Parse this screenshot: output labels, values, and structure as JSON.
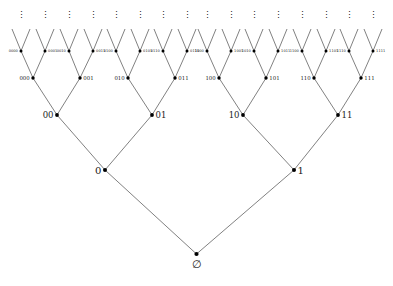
{
  "figure": {
    "kind": "binary-tree-diagram",
    "background_color": "#ffffff",
    "edge_color": "#2b2b2b",
    "node_color": "#000000",
    "label_color": "#1a1a1a",
    "width": 393,
    "height": 286,
    "max_drawn_depth": 4,
    "continuation_glyph": "⋮"
  },
  "levels": [
    {
      "depth": 0,
      "y": 254,
      "node_radius": 2.1,
      "font_size": 11,
      "label_placement": "below",
      "nodes": [
        {
          "id": "root",
          "label": "∅",
          "x": 196.5
        }
      ]
    },
    {
      "depth": 1,
      "y": 170,
      "node_radius": 2.0,
      "font_size": 10,
      "label_placement": "side",
      "nodes": [
        {
          "id": "0",
          "label": "0",
          "x": 105,
          "side": "left"
        },
        {
          "id": "1",
          "label": "1",
          "x": 294,
          "side": "right"
        }
      ]
    },
    {
      "depth": 2,
      "y": 115,
      "node_radius": 1.9,
      "font_size": 8.5,
      "label_placement": "side",
      "nodes": [
        {
          "id": "00",
          "label": "00",
          "x": 57,
          "side": "left"
        },
        {
          "id": "01",
          "label": "01",
          "x": 152,
          "side": "right"
        },
        {
          "id": "10",
          "label": "10",
          "x": 243,
          "side": "left"
        },
        {
          "id": "11",
          "label": "11",
          "x": 338,
          "side": "right"
        }
      ]
    },
    {
      "depth": 3,
      "y": 78,
      "node_radius": 1.7,
      "font_size": 5.4,
      "label_placement": "side",
      "nodes": [
        {
          "id": "000",
          "label": "000",
          "x": 33,
          "side": "left"
        },
        {
          "id": "001",
          "label": "001",
          "x": 80,
          "side": "right"
        },
        {
          "id": "010",
          "label": "010",
          "x": 128,
          "side": "left"
        },
        {
          "id": "011",
          "label": "011",
          "x": 175,
          "side": "right"
        },
        {
          "id": "100",
          "label": "100",
          "x": 219,
          "side": "left"
        },
        {
          "id": "101",
          "label": "101",
          "x": 266,
          "side": "right"
        },
        {
          "id": "110",
          "label": "110",
          "x": 314,
          "side": "left"
        },
        {
          "id": "111",
          "label": "111",
          "x": 361,
          "side": "right"
        }
      ]
    },
    {
      "depth": 4,
      "y": 51,
      "node_radius": 1.5,
      "font_size": 3.6,
      "label_placement": "side",
      "nodes": [
        {
          "id": "0000",
          "label": "0000",
          "x": 21,
          "side": "left"
        },
        {
          "id": "0001",
          "label": "0001",
          "x": 45,
          "side": "right"
        },
        {
          "id": "0010",
          "label": "0010",
          "x": 69,
          "side": "left"
        },
        {
          "id": "0011",
          "label": "0011",
          "x": 93,
          "side": "right"
        },
        {
          "id": "0100",
          "label": "0100",
          "x": 116,
          "side": "left"
        },
        {
          "id": "0101",
          "label": "0101",
          "x": 140,
          "side": "right"
        },
        {
          "id": "0110",
          "label": "0110",
          "x": 163,
          "side": "left"
        },
        {
          "id": "0111",
          "label": "0111",
          "x": 187,
          "side": "right"
        },
        {
          "id": "1000",
          "label": "1000",
          "x": 207,
          "side": "left"
        },
        {
          "id": "1001",
          "label": "1001",
          "x": 231,
          "side": "right"
        },
        {
          "id": "1010",
          "label": "1010",
          "x": 254,
          "side": "left"
        },
        {
          "id": "1011",
          "label": "1011",
          "x": 278,
          "side": "right"
        },
        {
          "id": "1100",
          "label": "1100",
          "x": 302,
          "side": "left"
        },
        {
          "id": "1101",
          "label": "1101",
          "x": 326,
          "side": "right"
        },
        {
          "id": "1110",
          "label": "1110",
          "x": 349,
          "side": "left"
        },
        {
          "id": "1111",
          "label": "1111",
          "x": 373,
          "side": "right"
        }
      ]
    }
  ],
  "stub_edges": {
    "comment": "short open branches rising from each depth-4 node toward the ellipses",
    "dy": 22,
    "dx": 9
  },
  "ellipses": {
    "y": 18,
    "glyph": "⋮",
    "font_size": 9,
    "x_positions": [
      21,
      45,
      69,
      93,
      116,
      140,
      163,
      187,
      207,
      231,
      254,
      278,
      302,
      326,
      349,
      373
    ]
  }
}
